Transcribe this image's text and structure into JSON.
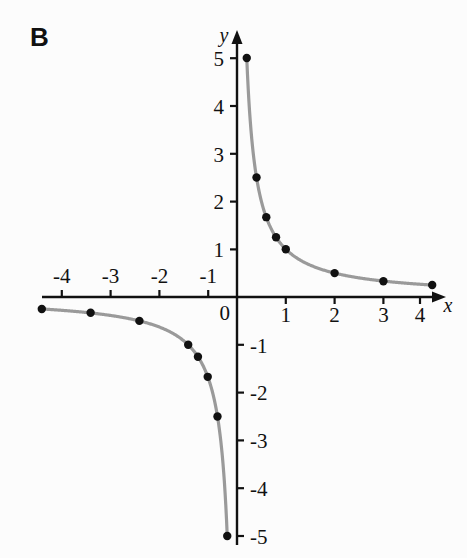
{
  "panel": {
    "label": "B"
  },
  "chart_data": {
    "type": "scatter",
    "title": "",
    "subtitle": "",
    "xlabel": "x",
    "ylabel": "y",
    "xlim": [
      -4.6,
      4.6
    ],
    "ylim": [
      -5.6,
      5.6
    ],
    "grid": false,
    "legend_position": "none",
    "origin_label": "0",
    "curve_color": "#9a9a9a",
    "point_color": "#111111",
    "axis_color": "#111111",
    "function": "y = 1/x",
    "xticks": [
      -4,
      -3,
      -2,
      -1,
      1,
      2,
      3,
      4
    ],
    "xtick_labels": [
      "-4",
      "-3",
      "-2",
      "-1",
      "1",
      "2",
      "3",
      "4"
    ],
    "yticks": [
      5,
      4,
      3,
      2,
      1,
      -1,
      -2,
      -3,
      -4,
      -5
    ],
    "ytick_labels": [
      "5",
      "4",
      "3",
      "2",
      "1",
      "-1",
      "-2",
      "-3",
      "-4",
      "-5"
    ],
    "series": [
      {
        "name": "right-branch",
        "x": [
          0.2,
          0.4,
          0.6,
          0.8,
          1,
          2,
          3,
          4
        ],
        "y": [
          5,
          2.5,
          1.67,
          1.25,
          1,
          0.5,
          0.33,
          0.25
        ]
      },
      {
        "name": "left-branch",
        "x": [
          -4,
          -3,
          -2,
          -1,
          -0.8,
          -0.6,
          -0.4,
          -0.2
        ],
        "y": [
          -0.25,
          -0.33,
          -0.5,
          -1,
          -1.25,
          -1.67,
          -2.5,
          -5
        ]
      }
    ]
  }
}
